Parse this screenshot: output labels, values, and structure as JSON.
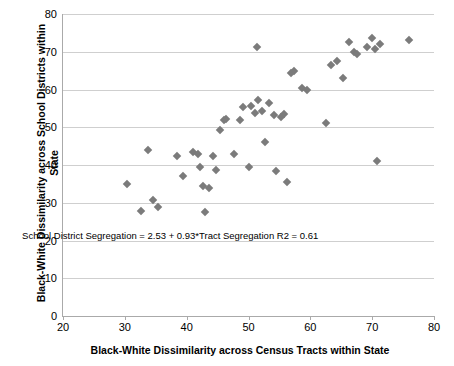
{
  "chart_data": {
    "type": "scatter",
    "title": "",
    "xlabel": "Black-White Dissimilarity across Census Tracts within State",
    "ylabel": "Black-White Dissimilarity across School Districts within State",
    "xlim": [
      20,
      80
    ],
    "ylim": [
      0,
      80
    ],
    "xticks": [
      20,
      30,
      40,
      50,
      60,
      70,
      80
    ],
    "yticks": [
      0,
      10,
      20,
      30,
      40,
      50,
      60,
      70,
      80
    ],
    "grid": "horizontal",
    "legend": "none",
    "annotation": "School District Segregation = 2.53 + 0.93*Tract Segregation  R2 = 0.61",
    "annotation_x": 37.5,
    "annotation_y": 21.5,
    "marker": "diamond",
    "marker_color": "#7b7b7b",
    "points": [
      {
        "x": 30.3,
        "y": 35.0
      },
      {
        "x": 32.6,
        "y": 27.7
      },
      {
        "x": 33.8,
        "y": 44.0
      },
      {
        "x": 34.6,
        "y": 30.6
      },
      {
        "x": 35.3,
        "y": 28.9
      },
      {
        "x": 38.4,
        "y": 42.3
      },
      {
        "x": 39.4,
        "y": 37.1
      },
      {
        "x": 41.1,
        "y": 43.4
      },
      {
        "x": 41.8,
        "y": 42.8
      },
      {
        "x": 42.2,
        "y": 39.6
      },
      {
        "x": 42.6,
        "y": 34.5
      },
      {
        "x": 43.0,
        "y": 27.6
      },
      {
        "x": 43.6,
        "y": 33.8
      },
      {
        "x": 44.3,
        "y": 42.3
      },
      {
        "x": 44.8,
        "y": 38.8
      },
      {
        "x": 45.4,
        "y": 49.3
      },
      {
        "x": 46.1,
        "y": 51.8
      },
      {
        "x": 46.3,
        "y": 52.3
      },
      {
        "x": 47.6,
        "y": 43.0
      },
      {
        "x": 48.6,
        "y": 52.0
      },
      {
        "x": 49.1,
        "y": 55.4
      },
      {
        "x": 50.0,
        "y": 39.4
      },
      {
        "x": 50.4,
        "y": 55.5
      },
      {
        "x": 51.0,
        "y": 53.7
      },
      {
        "x": 51.4,
        "y": 71.2
      },
      {
        "x": 51.6,
        "y": 57.2
      },
      {
        "x": 52.2,
        "y": 54.3
      },
      {
        "x": 52.6,
        "y": 46.0
      },
      {
        "x": 53.3,
        "y": 56.5
      },
      {
        "x": 54.2,
        "y": 53.2
      },
      {
        "x": 54.5,
        "y": 38.4
      },
      {
        "x": 55.2,
        "y": 52.6
      },
      {
        "x": 55.8,
        "y": 53.6
      },
      {
        "x": 56.3,
        "y": 35.5
      },
      {
        "x": 56.8,
        "y": 64.3
      },
      {
        "x": 57.3,
        "y": 64.9
      },
      {
        "x": 58.6,
        "y": 60.3
      },
      {
        "x": 59.4,
        "y": 59.9
      },
      {
        "x": 62.6,
        "y": 51.2
      },
      {
        "x": 63.4,
        "y": 66.6
      },
      {
        "x": 64.3,
        "y": 67.5
      },
      {
        "x": 65.3,
        "y": 63.0
      },
      {
        "x": 66.2,
        "y": 72.6
      },
      {
        "x": 67.1,
        "y": 70.0
      },
      {
        "x": 67.6,
        "y": 69.4
      },
      {
        "x": 69.2,
        "y": 71.2
      },
      {
        "x": 70.0,
        "y": 73.6
      },
      {
        "x": 70.4,
        "y": 70.7
      },
      {
        "x": 70.8,
        "y": 41.0
      },
      {
        "x": 71.3,
        "y": 72.0
      },
      {
        "x": 75.9,
        "y": 73.1
      }
    ]
  }
}
